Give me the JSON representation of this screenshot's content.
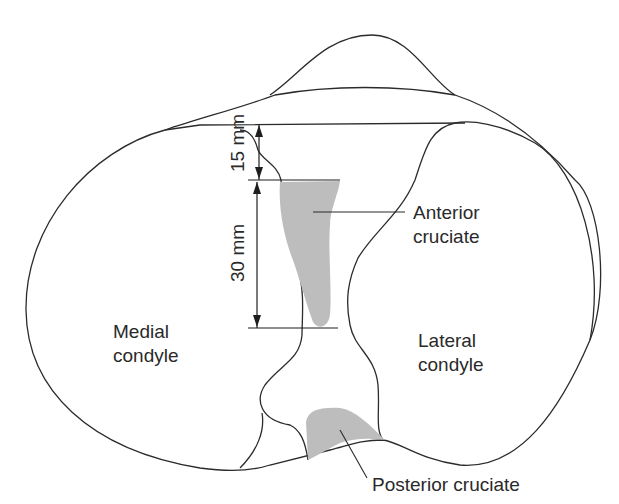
{
  "figure": {
    "labels": {
      "medial_line1": "Medial",
      "medial_line2": "condyle",
      "lateral_line1": "Lateral",
      "lateral_line2": "condyle",
      "anterior_line1": "Anterior",
      "anterior_line2": "cruciate",
      "posterior": "Posterior cruciate"
    },
    "dimensions": {
      "upper": "15 mm",
      "lower": "30 mm"
    },
    "colors": {
      "outline": "#2b2b2b",
      "ligament_fill": "#bdbdbd",
      "background": "#ffffff"
    }
  }
}
